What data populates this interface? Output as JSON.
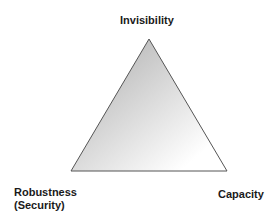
{
  "diagram": {
    "type": "triangle",
    "vertices": {
      "top": "Invisibility",
      "bottom_left": [
        "Robustness",
        "(Security)"
      ],
      "bottom_right": "Capacity"
    },
    "colors": {
      "fill_dark": "#a9a9a9",
      "fill_light": "#ffffff",
      "stroke": "#555555",
      "text": "#1a1a1a"
    }
  }
}
